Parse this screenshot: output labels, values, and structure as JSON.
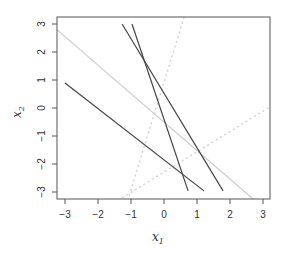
{
  "chart_data": {
    "type": "line",
    "title": "",
    "xlabel": "x1",
    "ylabel": "x2",
    "xlim": [
      -3.25,
      3.25
    ],
    "ylim": [
      -3.25,
      3.25
    ],
    "xticks": [
      -3,
      -2,
      -1,
      0,
      1,
      2,
      3
    ],
    "yticks": [
      -3,
      -2,
      -1,
      0,
      1,
      2,
      3
    ],
    "grid": false,
    "legend": null,
    "series": [
      {
        "name": "dark line 1",
        "style": "solid",
        "color": "#444444",
        "x": [
          -3.0,
          1.21
        ],
        "y": [
          0.89,
          -2.96
        ]
      },
      {
        "name": "dark line 2",
        "style": "solid",
        "color": "#444444",
        "x": [
          -0.97,
          0.73
        ],
        "y": [
          3.0,
          -2.96
        ]
      },
      {
        "name": "dark line 3",
        "style": "solid",
        "color": "#444444",
        "x": [
          -1.27,
          1.79
        ],
        "y": [
          3.0,
          -2.96
        ]
      },
      {
        "name": "gray line",
        "style": "solid",
        "color": "#cccccc",
        "x": [
          -3.24,
          2.7
        ],
        "y": [
          2.79,
          -3.25
        ]
      },
      {
        "name": "dotted steep line",
        "style": "dotted",
        "color": "#d0d0d0",
        "x": [
          0.61,
          -1.09
        ],
        "y": [
          3.25,
          -3.25
        ]
      },
      {
        "name": "dotted shallow line",
        "style": "dotted",
        "color": "#d0d0d0",
        "x": [
          -1.27,
          3.21
        ],
        "y": [
          -3.21,
          0.04
        ]
      }
    ]
  },
  "axes": {
    "x_title_main": "x",
    "x_title_sub": "1",
    "y_title_main": "x",
    "y_title_sub": "2",
    "x_tick_labels": [
      "−3",
      "−2",
      "−1",
      "0",
      "1",
      "2",
      "3"
    ],
    "y_tick_labels": [
      "−3",
      "−2",
      "−1",
      "0",
      "1",
      "2",
      "3"
    ]
  }
}
